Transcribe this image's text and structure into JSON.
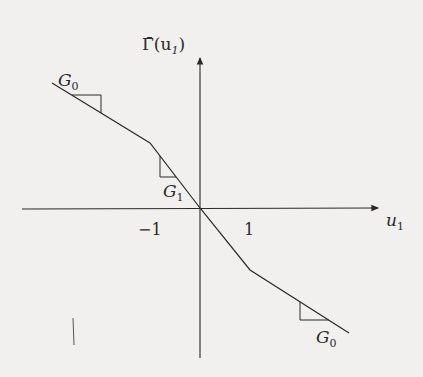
{
  "diagram": {
    "y_axis_label": "Γ̄(u",
    "y_axis_label_sub": "1",
    "y_axis_label_close": ")",
    "x_axis_label": "u",
    "x_axis_label_sub": "1",
    "tick_labels": {
      "neg_one": "−1",
      "pos_one": "1"
    },
    "slope_labels": {
      "outer_left": "G",
      "outer_left_sub": "0",
      "inner": "G",
      "inner_sub": "1",
      "outer_right": "G",
      "outer_right_sub": "0"
    },
    "curve": {
      "description": "piecewise-linear odd function: slope G1 on [-1,1], slope G0 outside",
      "breakpoints": [
        -1,
        1
      ]
    },
    "colors": {
      "ink": "#2a2a2a",
      "paper": "#f1f0ef"
    }
  }
}
